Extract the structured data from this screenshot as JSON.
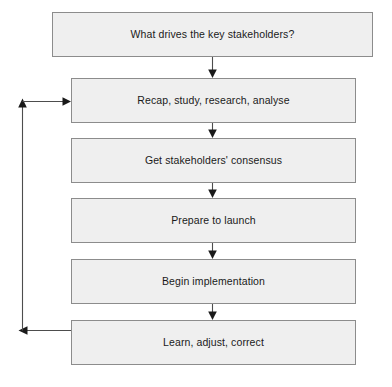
{
  "diagram": {
    "type": "flowchart",
    "orientation": "vertical",
    "title": "",
    "background_color": "#ffffff",
    "node_fill_color": "#efefef",
    "node_border_color": "#8c8c8c",
    "connector_color": "#4d4d4d",
    "text_color": "#1a1a1a",
    "nodes": [
      {
        "id": "n1",
        "label": "What drives the key stakeholders?"
      },
      {
        "id": "n2",
        "label": "Recap, study, research, analyse"
      },
      {
        "id": "n3",
        "label": "Get stakeholders' consensus"
      },
      {
        "id": "n4",
        "label": "Prepare to launch"
      },
      {
        "id": "n5",
        "label": "Begin implementation"
      },
      {
        "id": "n6",
        "label": "Learn, adjust, correct"
      }
    ],
    "edges": [
      {
        "from": "n1",
        "to": "n2",
        "kind": "down-arrow",
        "label": ""
      },
      {
        "from": "n2",
        "to": "n3",
        "kind": "down-arrow",
        "label": ""
      },
      {
        "from": "n3",
        "to": "n4",
        "kind": "down-arrow",
        "label": ""
      },
      {
        "from": "n4",
        "to": "n5",
        "kind": "down-arrow",
        "label": ""
      },
      {
        "from": "n5",
        "to": "n6",
        "kind": "down-arrow",
        "label": ""
      },
      {
        "from": "n6",
        "to": "n2",
        "kind": "feedback-loop-left",
        "label": ""
      }
    ]
  }
}
